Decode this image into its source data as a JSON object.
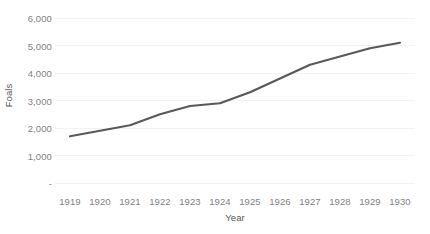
{
  "chart_data": {
    "type": "line",
    "title": "",
    "xlabel": "Year",
    "ylabel": "Foals",
    "categories": [
      "1919",
      "1920",
      "1921",
      "1922",
      "1923",
      "1924",
      "1925",
      "1926",
      "1927",
      "1928",
      "1929",
      "1930"
    ],
    "values": [
      1700,
      1900,
      2100,
      2500,
      2800,
      2900,
      3300,
      3800,
      4300,
      4600,
      4900,
      5100
    ],
    "series": [
      {
        "name": "Foals",
        "values": [
          1700,
          1900,
          2100,
          2500,
          2800,
          2900,
          3300,
          3800,
          4300,
          4600,
          4900,
          5100
        ]
      }
    ],
    "ylim": [
      0,
      6000
    ],
    "ytick_values": [
      6000,
      5000,
      4000,
      3000,
      2000,
      1000,
      0
    ],
    "ytick_labels": [
      "6,000",
      "5,000",
      "4,000",
      "3,000",
      "2,000",
      "1,000",
      "-"
    ],
    "xtick_labels": [
      "1919",
      "1920",
      "1921",
      "1922",
      "1923",
      "1924",
      "1925",
      "1926",
      "1927",
      "1928",
      "1929",
      "1930"
    ],
    "grid": true,
    "grid_axis": "y",
    "legend": false,
    "legend_position": "none",
    "line_color": "#595959",
    "gridline_color": "#f2f2f2",
    "tick_label_color": "#7f7f7f",
    "axis_title_color": "#595959",
    "background_color": "#ffffff"
  }
}
